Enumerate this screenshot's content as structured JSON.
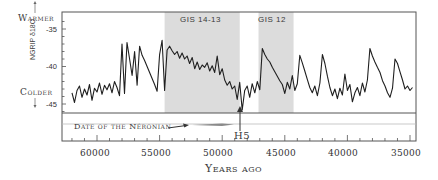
{
  "chart_data": {
    "type": "line",
    "title": "",
    "xlabel": "Years ago",
    "ylabel": "NGRIP δ18O",
    "x_reversed": true,
    "xlim": [
      62500,
      34500
    ],
    "ylim": [
      -46,
      -33
    ],
    "x_ticks": [
      60000,
      55000,
      50000,
      45000,
      40000,
      35000
    ],
    "y_ticks": [
      -35,
      -40,
      -45
    ],
    "grid": false,
    "annotations": {
      "warmer": "Warmer",
      "colder": "Colder",
      "shaded_periods": [
        {
          "label": "GIS 14-13",
          "start": 54600,
          "end": 48600
        },
        {
          "label": "GIS 12",
          "end": 44300,
          "start": 47100
        }
      ],
      "h5": {
        "label": "H5",
        "x": 48400
      },
      "neronian": {
        "label": "Date of the Néronian",
        "start": 53000,
        "end": 49200
      }
    },
    "series": [
      {
        "name": "NGRIP δ18O",
        "x": [
          62000,
          61800,
          61600,
          61400,
          61200,
          61000,
          60800,
          60600,
          60400,
          60200,
          60000,
          59800,
          59600,
          59400,
          59200,
          59000,
          58800,
          58600,
          58400,
          58200,
          58000,
          57800,
          57600,
          57400,
          57200,
          57000,
          56800,
          56600,
          56400,
          56200,
          56000,
          55800,
          55600,
          55400,
          55200,
          55000,
          54800,
          54600,
          54400,
          54200,
          54000,
          53800,
          53600,
          53400,
          53200,
          53000,
          52800,
          52600,
          52400,
          52200,
          52000,
          51800,
          51600,
          51400,
          51200,
          51000,
          50800,
          50600,
          50400,
          50200,
          50000,
          49800,
          49600,
          49400,
          49200,
          49000,
          48800,
          48600,
          48400,
          48200,
          48000,
          47800,
          47600,
          47400,
          47200,
          47000,
          46800,
          46600,
          46400,
          46200,
          46000,
          45800,
          45600,
          45400,
          45200,
          45000,
          44800,
          44600,
          44400,
          44200,
          44000,
          43800,
          43600,
          43400,
          43200,
          43000,
          42800,
          42600,
          42400,
          42200,
          42000,
          41800,
          41600,
          41400,
          41200,
          41000,
          40800,
          40600,
          40400,
          40200,
          40000,
          39800,
          39600,
          39400,
          39200,
          39000,
          38800,
          38600,
          38400,
          38200,
          38000,
          37800,
          37600,
          37400,
          37200,
          37000,
          36800,
          36600,
          36400,
          36200,
          36000,
          35800,
          35600,
          35400,
          35200,
          35000,
          34800
        ],
        "values": [
          -43.5,
          -44.8,
          -43.2,
          -42.6,
          -44.1,
          -43.0,
          -43.8,
          -42.4,
          -44.5,
          -42.9,
          -43.4,
          -42.2,
          -43.7,
          -42.5,
          -43.1,
          -42.3,
          -43.5,
          -42.0,
          -42.8,
          -43.9,
          -37.0,
          -43.6,
          -36.8,
          -39.0,
          -41.2,
          -38.0,
          -42.5,
          -37.3,
          -38.5,
          -39.2,
          -40.0,
          -40.8,
          -41.6,
          -42.4,
          -43.3,
          -38.4,
          -36.5,
          -43.2,
          -37.8,
          -37.3,
          -37.9,
          -38.4,
          -38.0,
          -38.9,
          -38.2,
          -39.0,
          -38.6,
          -39.6,
          -38.8,
          -40.3,
          -39.4,
          -40.4,
          -39.8,
          -40.1,
          -39.5,
          -40.6,
          -39.9,
          -40.8,
          -38.6,
          -41.1,
          -40.3,
          -41.8,
          -42.5,
          -42.0,
          -43.0,
          -42.6,
          -44.4,
          -42.1,
          -45.8,
          -43.2,
          -42.6,
          -44.1,
          -42.3,
          -43.5,
          -42.0,
          -43.1,
          -37.6,
          -38.4,
          -39.0,
          -39.4,
          -40.1,
          -40.7,
          -41.3,
          -41.9,
          -42.4,
          -43.6,
          -42.1,
          -43.0,
          -41.2,
          -43.2,
          -42.3,
          -38.5,
          -39.5,
          -40.6,
          -41.7,
          -42.8,
          -43.5,
          -42.6,
          -43.9,
          -42.2,
          -38.4,
          -39.6,
          -41.3,
          -42.8,
          -43.9,
          -43.0,
          -44.3,
          -42.9,
          -43.8,
          -41.0,
          -43.2,
          -42.4,
          -44.7,
          -43.5,
          -42.8,
          -43.9,
          -42.2,
          -43.4,
          -41.8,
          -37.6,
          -38.6,
          -39.4,
          -40.1,
          -40.8,
          -41.9,
          -42.6,
          -43.5,
          -44.1,
          -42.9,
          -39.0,
          -39.6,
          -40.7,
          -41.8,
          -43.0,
          -42.6,
          -43.2,
          -42.8
        ]
      }
    ]
  },
  "labels": {
    "warmer": "Warmer",
    "colder": "Colder",
    "ylabel": "NGRIP δ18O",
    "xlabel": "Years ago",
    "gis1413": "GIS 14-13",
    "gis12": "GIS 12",
    "h5": "H5",
    "neronian": "Date of the Néronian",
    "y35": "-35",
    "y40": "-40",
    "y45": "-45",
    "x60000": "60000",
    "x55000": "55000",
    "x50000": "50000",
    "x45000": "45000",
    "x40000": "40000",
    "x35000": "35000"
  },
  "colors": {
    "trace": "#1f1f1f",
    "shade": "#dcdcdc",
    "frame": "#555555",
    "neronian_bar": "#8a8a8a"
  }
}
